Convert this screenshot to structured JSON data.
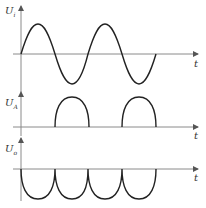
{
  "diagram": {
    "type": "waveform-timing-diagram",
    "panels": [
      {
        "id": "input",
        "y_label_main": "U",
        "y_label_sub": "i",
        "x_label": "t",
        "waveform": "full sine wave, 2 periods",
        "axis_y": 54,
        "amplitude_px": 30
      },
      {
        "id": "A",
        "y_label_main": "U",
        "y_label_sub": "A",
        "x_label": "t",
        "waveform": "half-wave rectified (positive humps during negative half-cycles of input)",
        "axis_y": 127,
        "amplitude_px": 30
      },
      {
        "id": "output",
        "y_label_main": "U",
        "y_label_sub": "o",
        "x_label": "t",
        "waveform": "full-wave rectified, negative polarity, 4 half-cycles",
        "axis_y": 169,
        "amplitude_px": 30
      }
    ],
    "colors": {
      "axis": "#8a8a8a",
      "wave": "#222222",
      "label": "#333333"
    }
  }
}
